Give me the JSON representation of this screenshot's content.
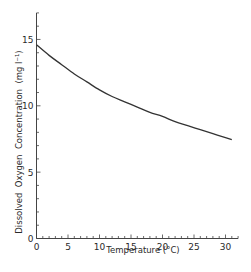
{
  "chart_data": {
    "type": "line",
    "title": "",
    "xlabel": "Temperature (°C)",
    "ylabel": "Dissolved  Oxygen  Concentration  (mg l⁻¹)",
    "xlim": [
      0,
      32
    ],
    "ylim": [
      0,
      17
    ],
    "x_ticks": [
      0,
      5,
      10,
      15,
      20,
      25,
      30
    ],
    "y_ticks": [
      0,
      5,
      10,
      15
    ],
    "x_minor_step": 1,
    "y_minor_step": 1,
    "grid": false,
    "legend": null,
    "series": [
      {
        "name": "Dissolved oxygen saturation",
        "x": [
          0,
          2,
          4,
          6,
          8,
          10,
          12,
          14,
          16,
          18,
          20,
          22,
          24,
          26,
          28,
          30,
          31
        ],
        "values": [
          14.6,
          13.8,
          13.1,
          12.4,
          11.8,
          11.2,
          10.7,
          10.3,
          9.9,
          9.5,
          9.2,
          8.8,
          8.5,
          8.2,
          7.9,
          7.6,
          7.45
        ]
      }
    ]
  }
}
